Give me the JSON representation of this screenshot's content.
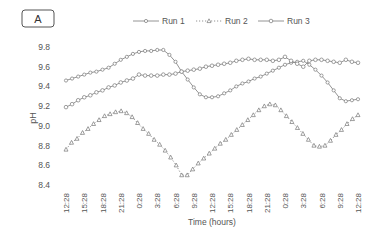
{
  "panel_label": "A",
  "chart_data": {
    "type": "line",
    "title": "",
    "panel": "A",
    "xlabel": "Time (hours)",
    "ylabel": "pH",
    "ylim": [
      8.4,
      9.8
    ],
    "yticks": [
      8.4,
      8.6,
      8.8,
      9.0,
      9.2,
      9.4,
      9.6,
      9.8
    ],
    "ytick_labels": [
      "8.4",
      "8.6",
      "8.8",
      "9.0",
      "9.2",
      "9.4",
      "9.6",
      "9.8"
    ],
    "xtick_labels": [
      "12:28",
      "15:28",
      "18:28",
      "21:28",
      "0:28",
      "3:28",
      "6:28",
      "9:28",
      "12:28",
      "15:28",
      "18:28",
      "21:28",
      "0:28",
      "3:28",
      "6:28",
      "9:28",
      "12:28"
    ],
    "grid": false,
    "legend_position": "top",
    "x_hours": [
      0,
      1,
      2,
      3,
      4,
      5,
      6,
      7,
      8,
      9,
      10,
      11,
      12,
      13,
      14,
      15,
      16,
      17,
      18,
      19,
      20,
      21,
      22,
      23,
      24,
      25,
      26,
      27,
      28,
      29,
      30,
      31,
      32,
      33,
      34,
      35,
      36,
      37,
      38,
      39,
      40,
      41,
      42,
      43,
      44,
      45,
      46,
      47,
      48
    ],
    "series": [
      {
        "name": "Run 1",
        "marker": "diamond",
        "line": "solid",
        "values": [
          9.46,
          9.48,
          9.5,
          9.52,
          9.54,
          9.55,
          9.57,
          9.59,
          9.63,
          9.67,
          9.7,
          9.73,
          9.75,
          9.76,
          9.76,
          9.77,
          9.77,
          9.72,
          9.65,
          9.55,
          9.47,
          9.39,
          9.32,
          9.29,
          9.29,
          9.3,
          9.33,
          9.36,
          9.4,
          9.43,
          9.45,
          9.48,
          9.5,
          9.53,
          9.56,
          9.59,
          9.62,
          9.64,
          9.65,
          9.66,
          9.62,
          9.57,
          9.51,
          9.44,
          9.36,
          9.28,
          9.25,
          9.26,
          9.27
        ]
      },
      {
        "name": "Run 2",
        "marker": "triangle",
        "line": "dotted",
        "values": [
          8.76,
          8.83,
          8.87,
          8.93,
          8.97,
          9.02,
          9.06,
          9.1,
          9.12,
          9.14,
          9.15,
          9.13,
          9.09,
          9.03,
          8.97,
          8.92,
          8.86,
          8.81,
          8.75,
          8.68,
          8.6,
          8.5,
          8.5,
          8.56,
          8.62,
          8.67,
          8.72,
          8.77,
          8.82,
          8.86,
          8.91,
          8.96,
          9.01,
          9.06,
          9.11,
          9.16,
          9.2,
          9.22,
          9.21,
          9.16,
          9.1,
          9.04,
          8.98,
          8.92,
          8.86,
          8.8,
          8.79,
          8.8,
          8.85,
          8.91,
          8.96,
          9.02,
          9.07,
          9.11
        ]
      },
      {
        "name": "Run 3",
        "marker": "circle",
        "line": "solid",
        "values": [
          9.19,
          9.22,
          9.26,
          9.29,
          9.31,
          9.34,
          9.36,
          9.39,
          9.41,
          9.44,
          9.46,
          9.48,
          9.52,
          9.51,
          9.51,
          9.51,
          9.52,
          9.52,
          9.53,
          9.55,
          9.56,
          9.57,
          9.58,
          9.6,
          9.61,
          9.62,
          9.63,
          9.64,
          9.66,
          9.67,
          9.68,
          9.67,
          9.67,
          9.67,
          9.66,
          9.67,
          9.7,
          9.66,
          9.63,
          9.6,
          9.66,
          9.67,
          9.67,
          9.66,
          9.65,
          9.64,
          9.67,
          9.65,
          9.64
        ]
      }
    ]
  }
}
